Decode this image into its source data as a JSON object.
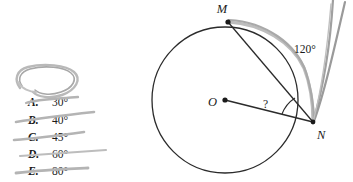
{
  "problem": {
    "type": "geometry-multiple-choice",
    "figure": {
      "circle": {
        "center_label": "O",
        "center": [
          225,
          100
        ],
        "radius": 73,
        "stroke": "#2b2b2b"
      },
      "points": [
        {
          "name": "M",
          "label": "M",
          "x": 228,
          "y": 22,
          "label_x": 224,
          "label_y": 13
        },
        {
          "name": "N",
          "label": "N",
          "x": 313,
          "y": 122,
          "label_x": 316,
          "label_y": 137
        },
        {
          "name": "O",
          "label": "O",
          "x": 225,
          "y": 100,
          "label_x": 211,
          "label_y": 106
        }
      ],
      "segments": [
        {
          "name": "chord-MN",
          "from": "M",
          "to": "N"
        },
        {
          "name": "radius-ON",
          "from": "O",
          "to": "N"
        }
      ],
      "unknown_angle": {
        "label": "?",
        "vertex": "N",
        "between": [
          "N-O",
          "N-M"
        ],
        "label_x": 262,
        "label_y": 108
      },
      "arc_highlight": {
        "name": "arc-MN",
        "color": "#9e9e9e",
        "from": "M",
        "to": "N",
        "measure_label": "120°"
      },
      "exterior_rays": {
        "name": "tangent-rays-from-N",
        "count": 2,
        "color": "#8f8f8f",
        "origin": "N",
        "direction": "up-right"
      },
      "angle_120": {
        "label": "120°",
        "x": 295,
        "y": 52
      }
    },
    "choices": [
      {
        "letter": "A.",
        "value": "30°",
        "struck_out": true,
        "y": 106
      },
      {
        "letter": "B.",
        "value": "40°",
        "struck_out": true,
        "y": 124
      },
      {
        "letter": "C.",
        "value": "45°",
        "struck_out": true,
        "y": 141
      },
      {
        "letter": "D.",
        "value": "60°",
        "struck_out": true,
        "y": 158
      },
      {
        "letter": "E.",
        "value": "80°",
        "struck_out": true,
        "y": 175
      }
    ],
    "annotations": {
      "loop_scribble": {
        "name": "pencil-loop-scribble",
        "color": "#adadad",
        "description": "hand-drawn gray oval loop above choice A"
      },
      "strike_color": "#b4b4b4"
    },
    "colors": {
      "ink": "#1a1a1a",
      "figure_stroke": "#2b2b2b",
      "pencil_gray": "#9e9e9e",
      "strike_gray": "#b4b4b4",
      "background": "#ffffff"
    }
  }
}
